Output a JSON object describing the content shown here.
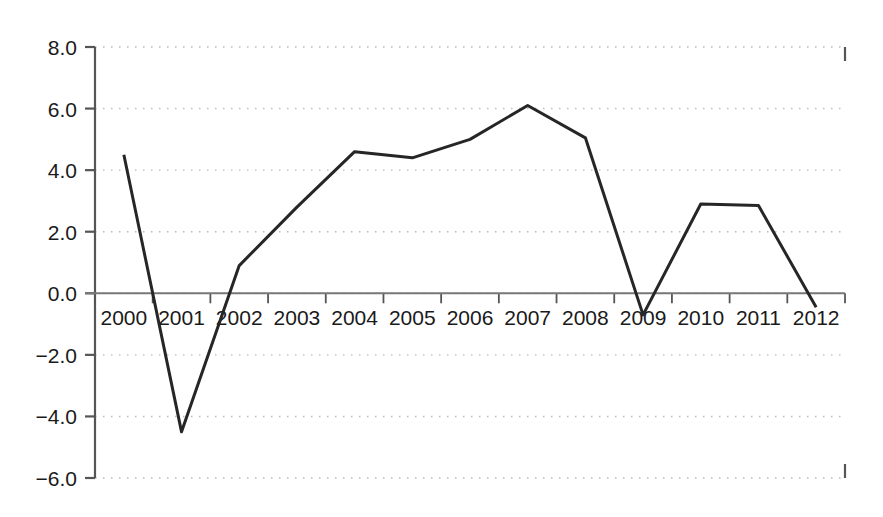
{
  "chart_data": {
    "type": "line",
    "title": "",
    "subtitle": "",
    "xlabel": "",
    "ylabel": "",
    "categories": [
      "2000",
      "2001",
      "2002",
      "2003",
      "2004",
      "2005",
      "2006",
      "2007",
      "2008",
      "2009",
      "2010",
      "2011",
      "2012"
    ],
    "values": [
      4.5,
      -4.5,
      0.9,
      2.8,
      4.6,
      4.4,
      5.0,
      6.1,
      5.05,
      -0.7,
      2.9,
      2.85,
      -0.45
    ],
    "series": [
      {
        "name": "",
        "values": [
          4.5,
          -4.5,
          0.9,
          2.8,
          4.6,
          4.4,
          5.0,
          6.1,
          5.05,
          -0.7,
          2.9,
          2.85,
          -0.45
        ]
      }
    ],
    "ylim": [
      -6.0,
      8.0
    ],
    "yticks": [
      8.0,
      6.0,
      4.0,
      2.0,
      0.0,
      -2.0,
      -4.0,
      -6.0
    ],
    "ytick_labels": [
      "8.0",
      "6.0",
      "4.0",
      "2.0",
      "0.0",
      "−2.0",
      "−4.0",
      "−6.0"
    ],
    "xtick_labels": [
      "2000",
      "2001",
      "2002",
      "2003",
      "2004",
      "2005",
      "2006",
      "2007",
      "2008",
      "2009",
      "2010",
      "2011",
      "2012"
    ],
    "grid": true,
    "grid_style": "dotted-horizontal",
    "legend": false,
    "legend_position": "none",
    "line_color": "#262626",
    "line_width": 3,
    "axis_color": "#555555",
    "grid_color": "#bbbbbb",
    "zero_line_value": 0.0,
    "annotations": []
  },
  "plot": {
    "x_axis_left_px": 95,
    "x_axis_right_px": 845,
    "y_top_px": 47,
    "y_bottom_px": 478,
    "y_zero_px": 296
  }
}
